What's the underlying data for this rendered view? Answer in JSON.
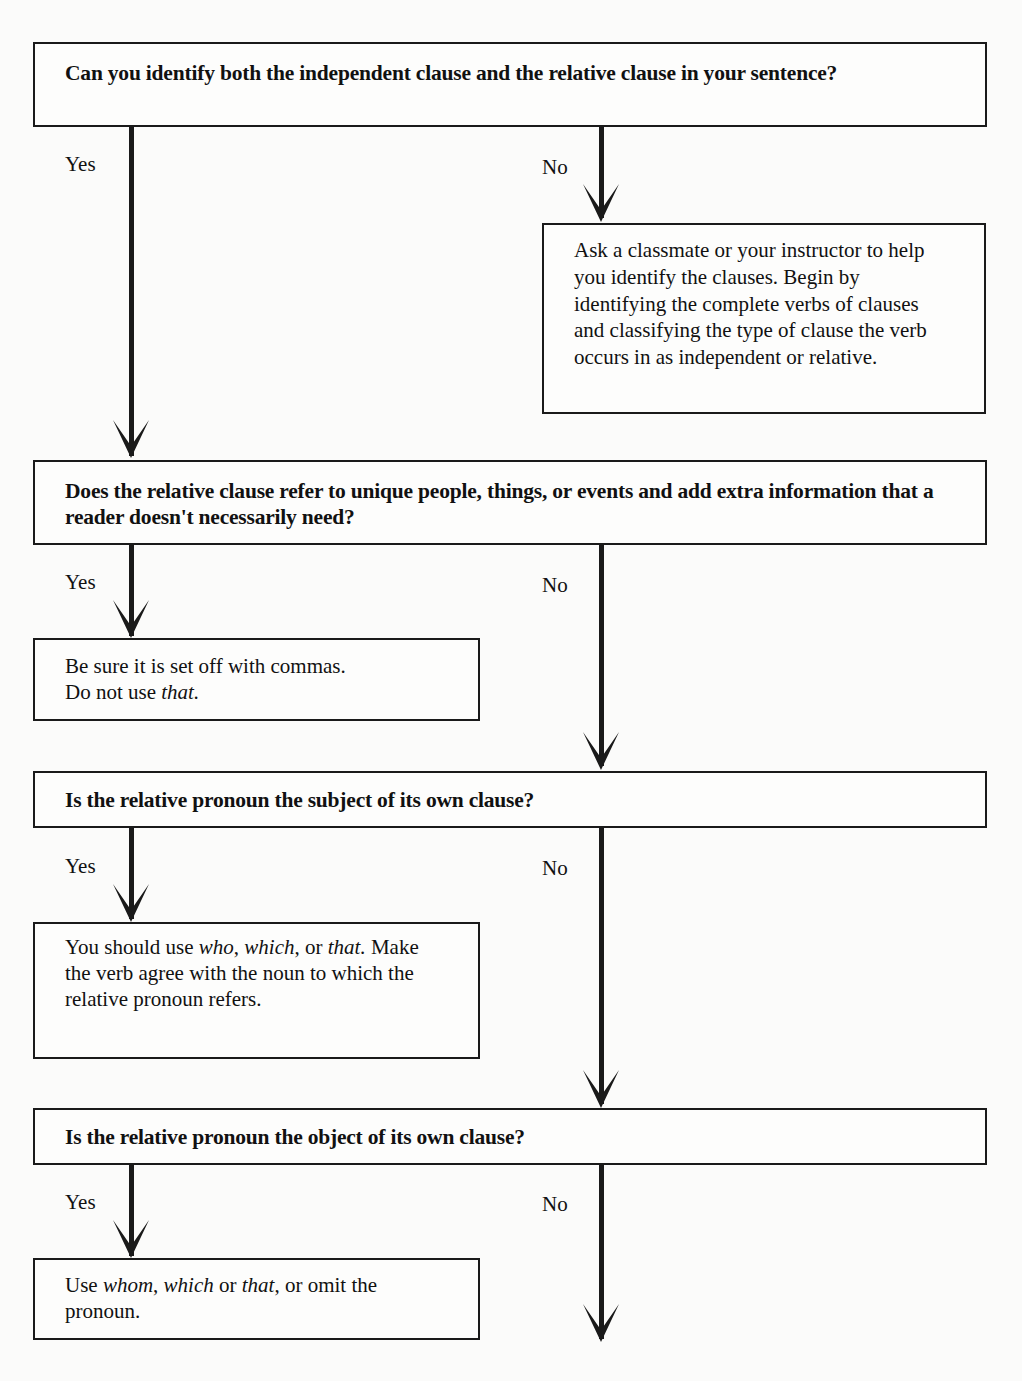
{
  "flowchart": {
    "q1": {
      "text": "Can you identify both the independent clause and the relative clause in your sentence?",
      "yes": "Yes",
      "no": "No",
      "no_result": "Ask a classmate or your instructor to help you identify the clauses. Begin by identifying the complete verbs of clauses and classifying the type of clause the verb occurs in as independent or relative."
    },
    "q2": {
      "text": "Does the relative clause refer to unique people, things, or events and add extra information that a reader doesn't necessarily need?",
      "yes": "Yes",
      "no": "No",
      "yes_result": {
        "line1": "Be sure it is set off with commas.",
        "line2_prefix": "Do not use ",
        "line2_italic": "that."
      }
    },
    "q3": {
      "text": "Is the relative pronoun the subject of its own clause?",
      "yes": "Yes",
      "no": "No",
      "yes_result": {
        "t1": "You should use ",
        "i1": "who",
        "t2": ", ",
        "i2": "which",
        "t3": ", or ",
        "i3": "that.",
        "t4": " Make the verb agree with the noun to which the relative pronoun refers."
      }
    },
    "q4": {
      "text": "Is the relative pronoun the object of its own clause?",
      "yes": "Yes",
      "no": "No",
      "yes_result": {
        "t1": "Use ",
        "i1": "whom",
        "t2": ", ",
        "i2": "which",
        "t3": " or ",
        "i3": "that",
        "t4": ", or omit the pronoun."
      }
    }
  }
}
